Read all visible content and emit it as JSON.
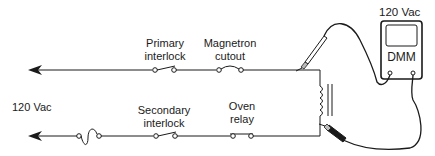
{
  "diagram": {
    "source_label": "120 Vac",
    "meter": {
      "reading": "120 Vac",
      "name": "DMM"
    },
    "components": [
      {
        "id": "primary-interlock",
        "line1": "Primary",
        "line2": "interlock",
        "type": "switch",
        "circuit": "top"
      },
      {
        "id": "magnetron-cutout",
        "line1": "Magnetron",
        "line2": "cutout",
        "type": "thermal-cutout",
        "circuit": "top"
      },
      {
        "id": "fuse",
        "type": "fuse",
        "circuit": "bottom"
      },
      {
        "id": "secondary-interlock",
        "line1": "Secondary",
        "line2": "interlock",
        "type": "switch",
        "circuit": "bottom"
      },
      {
        "id": "oven-relay",
        "line1": "Oven",
        "line2": "relay",
        "type": "switch",
        "circuit": "bottom"
      },
      {
        "id": "transformer",
        "type": "transformer-primary",
        "circuit": "load"
      }
    ],
    "colors": {
      "line": "#1a1a1a",
      "background": "#ffffff"
    }
  }
}
